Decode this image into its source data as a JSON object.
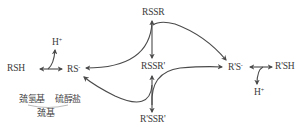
{
  "diagram": {
    "nodes": {
      "rsh": {
        "label": "RSH",
        "sup": ""
      },
      "rs_minus": {
        "label": "RS",
        "sup": "-"
      },
      "h_left": {
        "label": "H",
        "sup": "+"
      },
      "rssr": {
        "label": "RSSR",
        "sup": ""
      },
      "rssr_prime": {
        "label": "RSSR'",
        "sup": ""
      },
      "rpssrp": {
        "label": "R'SSR'",
        "sup": ""
      },
      "rps_minus": {
        "label": "R'S",
        "sup": "-"
      },
      "rpsh": {
        "label": "R'SH",
        "sup": ""
      },
      "h_right": {
        "label": "H",
        "sup": "+"
      }
    },
    "labels": {
      "sulfhydryl": "巯氢基",
      "thiolate": "硫醇盐",
      "thiol_group": "巯基"
    },
    "colors": {
      "line": "#4a4a4a",
      "text": "#3a3a3a"
    },
    "edges": [
      {
        "from": "RSH",
        "to": "RS-",
        "type": "bidirectional",
        "side": "H+"
      },
      {
        "from": "RSSR",
        "to": "RS-",
        "type": "curved"
      },
      {
        "from": "RSSR",
        "to": "R'S-",
        "type": "curved"
      },
      {
        "from": "RSSR",
        "to": "RSSR'",
        "type": "bidirectional-vertical"
      },
      {
        "from": "R'SSR'",
        "to": "RS-",
        "type": "curved"
      },
      {
        "from": "RSSR'",
        "to": "R'S-",
        "type": "curved"
      },
      {
        "from": "R'SSR'",
        "to": "RSSR'",
        "type": "bidirectional-vertical"
      },
      {
        "from": "R'S-",
        "to": "R'SH",
        "type": "bidirectional",
        "side": "H+"
      }
    ]
  }
}
